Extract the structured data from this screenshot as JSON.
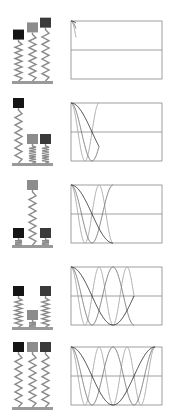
{
  "diagram": {
    "title": "",
    "colors": {
      "background": "#ffffff",
      "base_plate": "#9a9a9a",
      "spring": "#8a8a8a",
      "axis": "#888888",
      "oscillator_fast": "#1a1a1a",
      "oscillator_medium": "#8c8c8c",
      "oscillator_slow": "#3a3a3a",
      "curve_fast": "#aaaaaa",
      "curve_medium": "#888888",
      "curve_slow": "#333333"
    },
    "oscillators": [
      {
        "name": "left",
        "period_px": 28,
        "block_color": "#151515",
        "curve_color": "#a8a8a8"
      },
      {
        "name": "middle",
        "period_px": 42,
        "block_color": "#8c8c8c",
        "curve_color": "#7a7a7a"
      },
      {
        "name": "right",
        "period_px": 84,
        "block_color": "#3a3a3a",
        "curve_color": "#2e2e2e"
      }
    ],
    "panels": [
      {
        "index": 1,
        "top": 0,
        "t_end_px": 5
      },
      {
        "index": 2,
        "top": 82,
        "t_end_px": 28
      },
      {
        "index": 3,
        "top": 164,
        "t_end_px": 42
      },
      {
        "index": 4,
        "top": 246,
        "t_end_px": 63
      },
      {
        "index": 5,
        "top": 326,
        "t_end_px": 84
      }
    ]
  }
}
